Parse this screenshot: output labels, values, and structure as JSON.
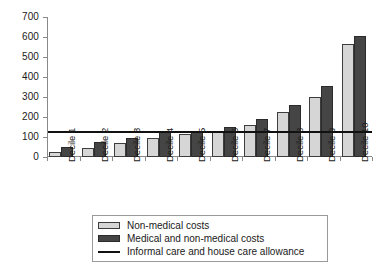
{
  "chart_data": {
    "type": "bar",
    "title": "",
    "xlabel": "",
    "ylabel": "",
    "ylim": [
      0,
      700
    ],
    "yticks": [
      0,
      100,
      200,
      300,
      400,
      500,
      600,
      700
    ],
    "ytick_labels": [
      "0",
      "100",
      "200",
      "300",
      "400",
      "500",
      "600",
      "700"
    ],
    "grid": false,
    "legend_position": "bottom",
    "categories": [
      "Decile 1",
      "Decile 2",
      "Decile 3",
      "Decile 4",
      "Decile 5",
      "Decile 6",
      "Decile 7",
      "Decile 8",
      "Decile 9",
      "Decile 10"
    ],
    "series": [
      {
        "name": "Non-medical costs",
        "color": "#d6d6d6",
        "values": [
          25,
          45,
          68,
          95,
          115,
          125,
          160,
          225,
          300,
          565
        ]
      },
      {
        "name": "Medical and non-medical costs",
        "color": "#454545",
        "values": [
          48,
          75,
          97,
          125,
          132,
          150,
          190,
          258,
          355,
          605
        ]
      }
    ],
    "reference_line": {
      "name": "Informal care and house care allowance",
      "color": "#111111",
      "value": 125
    }
  },
  "legend": {
    "items": [
      {
        "label": "Non-medical costs",
        "swatch": "light"
      },
      {
        "label": "Medical and non-medical costs",
        "swatch": "dark"
      },
      {
        "label": "Informal care and house care allowance",
        "swatch": "line"
      }
    ]
  }
}
